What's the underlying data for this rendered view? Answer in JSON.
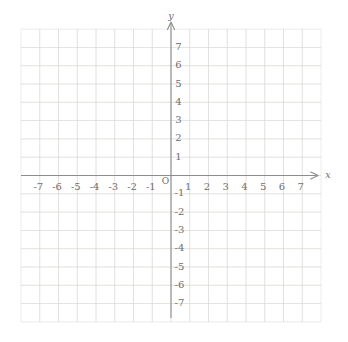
{
  "figure": {
    "background": "#ffffff"
  },
  "chart_data": {
    "type": "scatter",
    "points": [],
    "title": "",
    "xlabel": "x",
    "ylabel": "y",
    "origin_label": "O",
    "xlim": [
      -8,
      8
    ],
    "ylim": [
      -8,
      8
    ],
    "x_ticks": [
      -7,
      -6,
      -5,
      -4,
      -3,
      -2,
      -1,
      1,
      2,
      3,
      4,
      5,
      6,
      7
    ],
    "y_ticks": [
      7,
      6,
      5,
      4,
      3,
      2,
      1,
      -1,
      -2,
      -3,
      -4,
      -5,
      -6,
      -7
    ],
    "grid": true,
    "legend": false,
    "colors": {
      "grid": "#d7d5d2",
      "axis": "#8d8d8d",
      "text": "#6e6e6e"
    }
  }
}
